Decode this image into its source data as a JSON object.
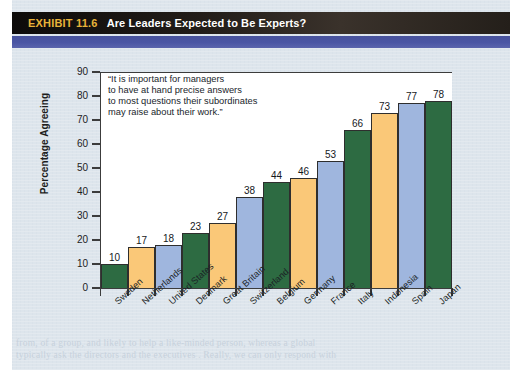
{
  "header": {
    "exhibit_number": "EXHIBIT 11.6",
    "title": "Are Leaders Expected to Be Experts?"
  },
  "quote": {
    "line1": "“It is important for managers",
    "line2": "to have at hand precise answers",
    "line3": "to most questions their subordinates",
    "line4": "may raise about their work.”"
  },
  "colors": {
    "bar_green": "#2d6b42",
    "bar_orange": "#fac878",
    "bar_blue": "#9fb6de",
    "header_black": "#191512",
    "exhibit_gold": "#e8b33a",
    "rule_blue": "#4a55a4",
    "page_background": "#dde5ec",
    "plot_background": "#ffffff",
    "axis": "#3c3c3c"
  },
  "bleed_text": {
    "line1": "from, of a group, and likely to help a like-minded person, whereas a global",
    "line2": "typically ask the directors and the executives . Really, we can only respond with"
  },
  "chart_data": {
    "type": "bar",
    "title": "Are Leaders Expected to Be Experts?",
    "xlabel": "",
    "ylabel": "Percentage Agreeing",
    "ylim": [
      0,
      90
    ],
    "yticks": [
      0,
      10,
      20,
      30,
      40,
      50,
      60,
      70,
      80,
      90
    ],
    "grid": false,
    "legend": null,
    "annotation": "“It is important for managers to have at hand precise answers to most questions their subordinates may raise about their work.”",
    "color_cycle": [
      "#2d6b42",
      "#fac878",
      "#9fb6de"
    ],
    "categories": [
      "Sweden",
      "Netherlands",
      "United States",
      "Denmark",
      "Great Britain",
      "Switzerland",
      "Belgium",
      "Germany",
      "France",
      "Italy",
      "Indonesia",
      "Spain",
      "Japan"
    ],
    "values": [
      10,
      17,
      18,
      23,
      27,
      38,
      44,
      46,
      53,
      66,
      73,
      77,
      78
    ],
    "bars": [
      {
        "category": "Sweden",
        "value": 10,
        "color": "#2d6b42"
      },
      {
        "category": "Netherlands",
        "value": 17,
        "color": "#fac878"
      },
      {
        "category": "United States",
        "value": 18,
        "color": "#9fb6de"
      },
      {
        "category": "Denmark",
        "value": 23,
        "color": "#2d6b42"
      },
      {
        "category": "Great Britain",
        "value": 27,
        "color": "#fac878"
      },
      {
        "category": "Switzerland",
        "value": 38,
        "color": "#9fb6de"
      },
      {
        "category": "Belgium",
        "value": 44,
        "color": "#2d6b42"
      },
      {
        "category": "Germany",
        "value": 46,
        "color": "#fac878"
      },
      {
        "category": "France",
        "value": 53,
        "color": "#9fb6de"
      },
      {
        "category": "Italy",
        "value": 66,
        "color": "#2d6b42"
      },
      {
        "category": "Indonesia",
        "value": 73,
        "color": "#fac878"
      },
      {
        "category": "Spain",
        "value": 77,
        "color": "#9fb6de"
      },
      {
        "category": "Japan",
        "value": 78,
        "color": "#2d6b42"
      }
    ]
  }
}
